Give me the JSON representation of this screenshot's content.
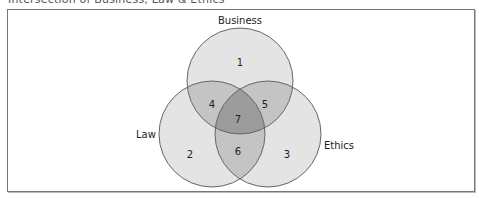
{
  "title": "Intersection of Business, Law & Ethics",
  "sets": [
    {
      "id": "business",
      "label": "Business"
    },
    {
      "id": "law",
      "label": "Law"
    },
    {
      "id": "ethics",
      "label": "Ethics"
    }
  ],
  "regions": [
    {
      "id": "r1",
      "label": "1",
      "sets": [
        "business"
      ]
    },
    {
      "id": "r2",
      "label": "2",
      "sets": [
        "law"
      ]
    },
    {
      "id": "r3",
      "label": "3",
      "sets": [
        "ethics"
      ]
    },
    {
      "id": "r4",
      "label": "4",
      "sets": [
        "business",
        "law"
      ]
    },
    {
      "id": "r5",
      "label": "5",
      "sets": [
        "business",
        "ethics"
      ]
    },
    {
      "id": "r6",
      "label": "6",
      "sets": [
        "law",
        "ethics"
      ]
    },
    {
      "id": "r7",
      "label": "7",
      "sets": [
        "business",
        "law",
        "ethics"
      ]
    }
  ],
  "colors": {
    "single": "#e4e4e4",
    "double": "#c4c4c4",
    "triple": "#9c9c9c",
    "stroke": "#666666"
  }
}
